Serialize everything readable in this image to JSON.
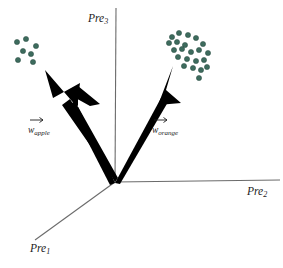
{
  "figure": {
    "background_color": "#ffffff",
    "width": 283,
    "height": 268
  },
  "axes": {
    "origin": {
      "x": 115,
      "y": 182
    },
    "items": [
      {
        "name": "pre1",
        "label_base": "Pre",
        "label_sub": "1",
        "label_x": 30,
        "label_y": 252,
        "line": {
          "x1": 115,
          "y1": 182,
          "x2": 35,
          "y2": 240
        },
        "direction": "down-left-diagonal"
      },
      {
        "name": "pre2",
        "label_base": "Pre",
        "label_sub": "2",
        "label_x": 247,
        "label_y": 195,
        "line": {
          "x1": 115,
          "y1": 182,
          "x2": 280,
          "y2": 180
        },
        "direction": "right-horizontal"
      },
      {
        "name": "pre3",
        "label_base": "Pre",
        "label_sub": "3",
        "label_x": 88,
        "label_y": 22,
        "line": {
          "x1": 116,
          "y1": 8,
          "x2": 115,
          "y2": 182
        },
        "direction": "up-vertical"
      }
    ]
  },
  "vectors": [
    {
      "name": "w-apple",
      "label_base": "w",
      "label_sub": "apple",
      "label_x": 28,
      "label_y": 133,
      "arrow_over_x": 30,
      "arrow_over_y": 120,
      "color": "#000000",
      "tip": {
        "x": 45,
        "y": 70
      },
      "tail": {
        "x": 115,
        "y": 182
      }
    },
    {
      "name": "w-orange",
      "label_base": "w",
      "label_sub": "orange",
      "label_x": 152,
      "label_y": 133,
      "arrow_over_x": 154,
      "arrow_over_y": 120,
      "color": "#000000",
      "tip": {
        "x": 173,
        "y": 66
      },
      "tail": {
        "x": 115,
        "y": 182
      }
    }
  ],
  "clusters": [
    {
      "name": "apple-cluster",
      "color": "#3d6b5d",
      "radius": 2.6,
      "points": [
        {
          "x": 17,
          "y": 42
        },
        {
          "x": 26,
          "y": 39
        },
        {
          "x": 36,
          "y": 46
        },
        {
          "x": 23,
          "y": 51
        },
        {
          "x": 31,
          "y": 54
        },
        {
          "x": 18,
          "y": 60
        },
        {
          "x": 33,
          "y": 62
        }
      ]
    },
    {
      "name": "orange-cluster",
      "color": "#3d6b5d",
      "radius": 2.6,
      "points": [
        {
          "x": 172,
          "y": 37
        },
        {
          "x": 179,
          "y": 33
        },
        {
          "x": 188,
          "y": 35
        },
        {
          "x": 196,
          "y": 38
        },
        {
          "x": 169,
          "y": 43
        },
        {
          "x": 177,
          "y": 42
        },
        {
          "x": 185,
          "y": 45
        },
        {
          "x": 203,
          "y": 44
        },
        {
          "x": 174,
          "y": 50
        },
        {
          "x": 182,
          "y": 49
        },
        {
          "x": 191,
          "y": 52
        },
        {
          "x": 199,
          "y": 50
        },
        {
          "x": 208,
          "y": 53
        },
        {
          "x": 178,
          "y": 57
        },
        {
          "x": 187,
          "y": 59
        },
        {
          "x": 196,
          "y": 61
        },
        {
          "x": 204,
          "y": 60
        },
        {
          "x": 184,
          "y": 66
        },
        {
          "x": 193,
          "y": 68
        },
        {
          "x": 201,
          "y": 70
        },
        {
          "x": 199,
          "y": 78
        },
        {
          "x": 207,
          "y": 67
        }
      ]
    }
  ]
}
